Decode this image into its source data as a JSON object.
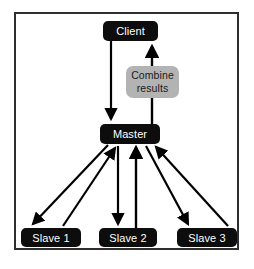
{
  "diagram": {
    "frame": {
      "border_color": "#2e2e2e",
      "background": "#ffffff"
    },
    "colors": {
      "node_dark_fill": "#0d0d0d",
      "node_dark_text": "#ffffff",
      "node_gray_fill": "#b3b3b3",
      "node_gray_text": "#1a1a1a",
      "arrow": "#000000"
    },
    "nodes": [
      {
        "id": "client",
        "label": "Client",
        "style": "dark"
      },
      {
        "id": "combine",
        "label_line1": "Combine",
        "label_line2": "results",
        "style": "gray"
      },
      {
        "id": "master",
        "label": "Master",
        "style": "dark"
      },
      {
        "id": "slave1",
        "label": "Slave 1",
        "style": "dark"
      },
      {
        "id": "slave2",
        "label": "Slave 2",
        "style": "dark"
      },
      {
        "id": "slave3",
        "label": "Slave 3",
        "style": "dark"
      }
    ],
    "edges": [
      {
        "id": "client-to-master",
        "from": "client",
        "to": "master",
        "direction": "down"
      },
      {
        "id": "master-to-client",
        "from": "master",
        "to": "client",
        "direction": "up",
        "passes": "combine"
      },
      {
        "id": "master-to-slave1",
        "from": "master",
        "to": "slave1",
        "direction": "down"
      },
      {
        "id": "slave1-to-master",
        "from": "slave1",
        "to": "master",
        "direction": "up"
      },
      {
        "id": "master-to-slave2",
        "from": "master",
        "to": "slave2",
        "direction": "down"
      },
      {
        "id": "slave2-to-master",
        "from": "slave2",
        "to": "master",
        "direction": "up"
      },
      {
        "id": "master-to-slave3",
        "from": "master",
        "to": "slave3",
        "direction": "down"
      },
      {
        "id": "slave3-to-master",
        "from": "slave3",
        "to": "master",
        "direction": "up"
      }
    ]
  }
}
